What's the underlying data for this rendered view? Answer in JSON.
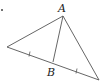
{
  "diagram": {
    "type": "triangle-median",
    "labels": {
      "apex": "A",
      "base_point": "B"
    },
    "points": {
      "left": [
        7,
        47
      ],
      "apex": [
        63,
        16
      ],
      "right": [
        99,
        80
      ],
      "B": [
        53,
        62
      ]
    },
    "tick_marks": 2,
    "stroke_color": "#555555"
  }
}
